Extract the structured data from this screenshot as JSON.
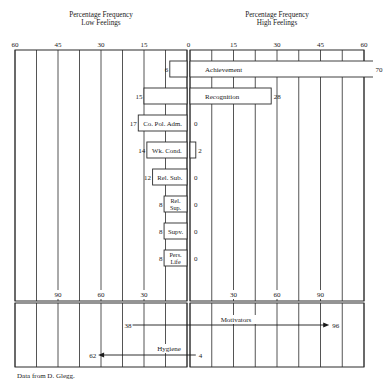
{
  "header": {
    "low": {
      "line1": "Percentage Frequency",
      "line2": "Low Feelings"
    },
    "high": {
      "line1": "Percentage Frequency",
      "line2": "High Feelings"
    }
  },
  "axis": {
    "top_low_ticks": [
      "60",
      "45",
      "30",
      "15",
      "0"
    ],
    "top_high_ticks": [
      "15",
      "30",
      "45",
      "60"
    ],
    "bottom_low_ticks": [
      "90",
      "60",
      "30"
    ],
    "bottom_high_ticks": [
      "30",
      "60",
      "90"
    ]
  },
  "footer": {
    "source": "Data from D. Glegg."
  },
  "colors": {
    "line": "#2a2a2a",
    "text": "#1a1a1a",
    "background": "#ffffff",
    "bar_fill": "#ffffff"
  },
  "chart_data": [
    {
      "type": "bar",
      "orientation": "horizontal-diverging",
      "title": "",
      "xlabel_left": "Percentage Frequency Low Feelings",
      "xlabel_right": "Percentage Frequency High Feelings",
      "categories": [
        "Achievement",
        "Recognition",
        "Co. Pol. Adm.",
        "Wk. Cond.",
        "Rel. Sub.",
        "Rel. Sup.",
        "Supv.",
        "Pers. Life"
      ],
      "category_display_lines": [
        [
          "Achievement"
        ],
        [
          "Recognition"
        ],
        [
          "Co. Pol. Adm."
        ],
        [
          "Wk. Cond."
        ],
        [
          "Rel. Sub."
        ],
        [
          "Rel.",
          "Sup."
        ],
        [
          "Supv."
        ],
        [
          "Pers.",
          "Life"
        ]
      ],
      "series": [
        {
          "name": "Low Feelings",
          "values": [
            6,
            15,
            17,
            14,
            12,
            8,
            8,
            8
          ]
        },
        {
          "name": "High Feelings",
          "values": [
            70,
            28,
            0,
            2,
            0,
            0,
            0,
            0
          ]
        }
      ],
      "xlim": [
        -60,
        60
      ],
      "xticks": [
        60,
        45,
        30,
        15,
        0,
        15,
        30,
        45,
        60
      ],
      "grid": true
    },
    {
      "type": "bar",
      "orientation": "horizontal-diverging-arrows",
      "title": "",
      "categories": [
        "Motivators",
        "Hygiene"
      ],
      "series": [
        {
          "name": "Low Feelings",
          "values": [
            38,
            62
          ]
        },
        {
          "name": "High Feelings",
          "values": [
            96,
            4
          ]
        }
      ],
      "arrow_direction": [
        "high",
        "low"
      ],
      "xlim": [
        -120,
        120
      ],
      "xticks": [
        90,
        60,
        30,
        30,
        60,
        90
      ],
      "grid": true
    }
  ]
}
